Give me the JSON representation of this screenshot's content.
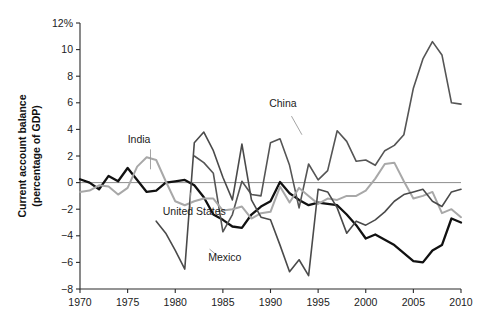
{
  "chart_data": {
    "type": "line",
    "title": "",
    "xlabel": "",
    "ylabel": "Current account balance (percentage of GDP)",
    "ylabel_line1": "Current account balance",
    "ylabel_line2": "(percentage of GDP)",
    "xlim": [
      1970,
      2010
    ],
    "ylim": [
      -8,
      12
    ],
    "grid": false,
    "legend_position": "inline-annotations",
    "x_ticks": [
      1970,
      1975,
      1980,
      1985,
      1990,
      1995,
      2000,
      2005,
      2010
    ],
    "x_tick_labels": [
      "1970",
      "1975",
      "1980",
      "1985",
      "1990",
      "1995",
      "2000",
      "2005",
      "2010"
    ],
    "y_ticks": [
      -8,
      -6,
      -4,
      -2,
      0,
      2,
      4,
      6,
      8,
      10,
      12
    ],
    "y_tick_labels": [
      "−8",
      "−6",
      "−4",
      "−2",
      "0",
      "2",
      "4",
      "6",
      "8",
      "10",
      "12%"
    ],
    "zero_reference_line": 0,
    "series": [
      {
        "name": "United States",
        "color": "#111111",
        "width": 2.3,
        "label_x": 1982.0,
        "label_y": -2.45,
        "leader": [
          [
            1981.6,
            -1.95
          ],
          [
            1981.6,
            -0.75
          ]
        ],
        "x": [
          1970,
          1971,
          1972,
          1973,
          1974,
          1975,
          1976,
          1977,
          1978,
          1979,
          1980,
          1981,
          1982,
          1983,
          1984,
          1985,
          1986,
          1987,
          1988,
          1989,
          1990,
          1991,
          1992,
          1993,
          1994,
          1995,
          1996,
          1997,
          1998,
          1999,
          2000,
          2001,
          2002,
          2003,
          2004,
          2005,
          2006,
          2007,
          2008,
          2009,
          2010
        ],
        "y": [
          0.25,
          0.0,
          -0.5,
          0.5,
          0.1,
          1.1,
          0.2,
          -0.7,
          -0.6,
          0.0,
          0.1,
          0.2,
          -0.2,
          -1.1,
          -2.4,
          -2.8,
          -3.3,
          -3.4,
          -2.4,
          -1.8,
          -1.4,
          0.05,
          -0.8,
          -1.3,
          -1.7,
          -1.5,
          -1.6,
          -1.7,
          -2.4,
          -3.2,
          -4.2,
          -3.9,
          -4.3,
          -4.7,
          -5.3,
          -5.9,
          -6.0,
          -5.1,
          -4.7,
          -2.7,
          -3.0
        ]
      },
      {
        "name": "China",
        "color": "#555555",
        "width": 1.6,
        "label_x": 1991.3,
        "label_y": 5.7,
        "leader": [
          [
            1992.2,
            5.0
          ],
          [
            1993.3,
            3.6
          ]
        ],
        "x": [
          1982,
          1983,
          1984,
          1985,
          1986,
          1987,
          1988,
          1989,
          1990,
          1991,
          1992,
          1993,
          1994,
          1995,
          1996,
          1997,
          1998,
          1999,
          2000,
          2001,
          2002,
          2003,
          2004,
          2005,
          2006,
          2007,
          2008,
          2009,
          2010
        ],
        "y": [
          2.0,
          1.5,
          0.7,
          -3.7,
          -2.4,
          0.1,
          -0.9,
          -1.0,
          3.0,
          3.3,
          1.3,
          -1.9,
          1.4,
          0.2,
          0.9,
          3.9,
          3.1,
          1.6,
          1.7,
          1.3,
          2.4,
          2.8,
          3.6,
          7.1,
          9.3,
          10.6,
          9.6,
          6.0,
          5.9
        ]
      },
      {
        "name": "India",
        "color": "#a8a8a8",
        "width": 2.0,
        "label_x": 1976.2,
        "label_y": 3.0,
        "leader": [
          [
            1977.4,
            2.5
          ],
          [
            1977.4,
            1.0
          ]
        ],
        "x": [
          1970,
          1971,
          1972,
          1973,
          1974,
          1975,
          1976,
          1977,
          1978,
          1979,
          1980,
          1981,
          1982,
          1983,
          1984,
          1985,
          1986,
          1987,
          1988,
          1989,
          1990,
          1991,
          1992,
          1993,
          1994,
          1995,
          1996,
          1997,
          1998,
          1999,
          2000,
          2001,
          2002,
          2003,
          2004,
          2005,
          2006,
          2007,
          2008,
          2009,
          2010
        ],
        "y": [
          -0.7,
          -0.6,
          -0.2,
          -0.3,
          -0.9,
          -0.4,
          1.2,
          1.9,
          1.7,
          0.1,
          -1.4,
          -1.7,
          -1.4,
          -1.2,
          -1.2,
          -2.1,
          -2.0,
          -1.8,
          -2.7,
          -2.3,
          -2.2,
          -0.3,
          -1.5,
          -0.4,
          -1.0,
          -1.6,
          -1.2,
          -1.3,
          -1.0,
          -1.0,
          -0.6,
          0.3,
          1.4,
          1.5,
          0.1,
          -1.2,
          -1.0,
          -0.7,
          -2.3,
          -2.0,
          -2.6
        ]
      },
      {
        "name": "Mexico",
        "color": "#4a4a4a",
        "width": 1.6,
        "label_x": 1985.2,
        "label_y": -5.9,
        "leader": [
          [
            1984.6,
            -5.6
          ],
          [
            1983.6,
            -5.0
          ]
        ],
        "x": [
          1978,
          1979,
          1980,
          1981,
          1982,
          1983,
          1984,
          1985,
          1986,
          1987,
          1988,
          1989,
          1990,
          1991,
          1992,
          1993,
          1994,
          1995,
          1996,
          1997,
          1998,
          1999,
          2000,
          2001,
          2002,
          2003,
          2004,
          2005,
          2006,
          2007,
          2008,
          2009,
          2010
        ],
        "y": [
          -2.9,
          -3.8,
          -5.1,
          -6.5,
          3.0,
          3.8,
          2.4,
          0.4,
          -1.3,
          2.9,
          -1.3,
          -2.6,
          -2.8,
          -4.7,
          -6.7,
          -5.8,
          -7.0,
          -0.5,
          -0.7,
          -1.9,
          -3.8,
          -2.9,
          -3.2,
          -2.8,
          -2.2,
          -1.4,
          -0.9,
          -0.7,
          -0.5,
          -1.4,
          -1.8,
          -0.7,
          -0.5
        ]
      }
    ]
  }
}
